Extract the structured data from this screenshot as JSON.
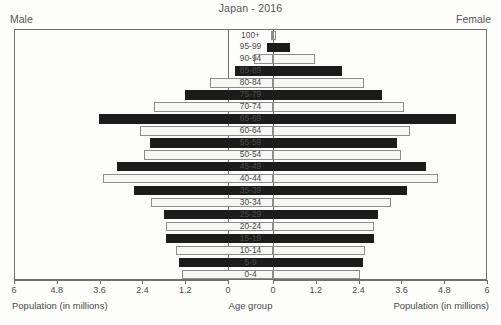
{
  "chart_data": {
    "type": "bar",
    "chart_style": "population-pyramid",
    "title": "Japan - 2016",
    "left_header": "Male",
    "right_header": "Female",
    "xlabel_left": "Population (in millions)",
    "xlabel_center": "Age group",
    "xlabel_right": "Population (in millions)",
    "ylabel": "Age group",
    "grid": false,
    "legend": "none",
    "xlim_left": [
      6,
      0
    ],
    "xlim_right": [
      0,
      6
    ],
    "ticks_left": [
      "6",
      "4.8",
      "3.6",
      "2.4",
      "1.2",
      "0"
    ],
    "ticks_right": [
      "0",
      "1.2",
      "2.4",
      "3.6",
      "4.8",
      "6"
    ],
    "tick_values": [
      0,
      1.2,
      2.4,
      3.6,
      4.8,
      6
    ],
    "categories": [
      "100+",
      "95-99",
      "90-94",
      "85-89",
      "80-84",
      "75-79",
      "70-74",
      "65-69",
      "60-64",
      "55-59",
      "50-54",
      "45-49",
      "40-44",
      "35-39",
      "30-34",
      "25-29",
      "20-24",
      "15-19",
      "10-14",
      "5-9",
      "0-4"
    ],
    "series": [
      {
        "name": "Male",
        "values": [
          0.02,
          0.18,
          0.52,
          1.06,
          1.76,
          2.47,
          3.33,
          4.87,
          3.74,
          3.46,
          3.61,
          4.38,
          4.78,
          3.89,
          3.43,
          3.07,
          2.99,
          2.99,
          2.71,
          2.64,
          2.56
        ]
      },
      {
        "name": "Female",
        "values": [
          0.08,
          0.49,
          1.18,
          1.94,
          2.55,
          3.05,
          3.66,
          5.12,
          3.83,
          3.49,
          3.59,
          4.28,
          4.64,
          3.76,
          3.3,
          2.93,
          2.84,
          2.84,
          2.58,
          2.51,
          2.44
        ]
      }
    ]
  }
}
